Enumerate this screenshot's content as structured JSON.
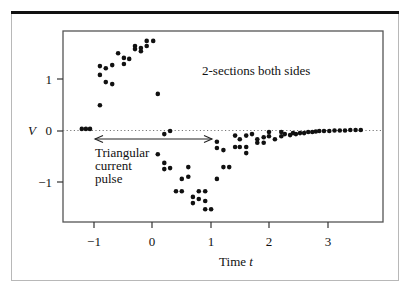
{
  "chart_data": {
    "type": "scatter",
    "title": "",
    "xlabel": "Time",
    "xlabel_var": "t",
    "ylabel": "V",
    "xlim": [
      -1.5,
      3.95
    ],
    "ylim": [
      -1.77,
      1.94
    ],
    "xticks": [
      -1,
      0,
      1,
      2,
      3
    ],
    "xtick_labels": [
      "−1",
      "0",
      "1",
      "2",
      "3"
    ],
    "yticks": [
      1,
      0,
      -1
    ],
    "ytick_labels": [
      "1",
      "0",
      "−1"
    ],
    "grid": false,
    "legend": null,
    "annotations": [
      {
        "text": "2-sections both sides",
        "x": 0.85,
        "y": 1.0
      },
      {
        "text_lines": [
          "Triangular",
          "current",
          "pulse"
        ],
        "x": -0.96,
        "y": -0.28
      },
      {
        "type": "double-arrow",
        "from": [
          -1.0,
          -0.15
        ],
        "to": [
          1.04,
          -0.15
        ]
      },
      {
        "type": "dotted-baseline",
        "y": 0
      }
    ],
    "series": [
      {
        "name": "measured V",
        "points": [
          [
            -1.2,
            0.04
          ],
          [
            -1.13,
            0.04
          ],
          [
            -1.06,
            0.04
          ],
          [
            -0.89,
            1.26
          ],
          [
            -0.79,
            1.22
          ],
          [
            -0.68,
            1.28
          ],
          [
            -0.89,
            1.09
          ],
          [
            -0.79,
            0.95
          ],
          [
            -0.68,
            0.91
          ],
          [
            -0.89,
            0.5
          ],
          [
            -0.58,
            1.51
          ],
          [
            -0.48,
            1.42
          ],
          [
            -0.39,
            1.4
          ],
          [
            -0.48,
            1.3
          ],
          [
            -0.29,
            1.65
          ],
          [
            -0.29,
            1.59
          ],
          [
            -0.19,
            1.61
          ],
          [
            -0.19,
            1.55
          ],
          [
            -0.09,
            1.75
          ],
          [
            -0.09,
            1.65
          ],
          [
            0.02,
            1.75
          ],
          [
            0.1,
            0.72
          ],
          [
            0.21,
            -0.06
          ],
          [
            0.31,
            0.0
          ],
          [
            0.1,
            -0.45
          ],
          [
            0.21,
            -0.62
          ],
          [
            0.21,
            -0.74
          ],
          [
            0.31,
            -0.72
          ],
          [
            0.62,
            -0.7
          ],
          [
            0.51,
            -0.93
          ],
          [
            0.62,
            -0.89
          ],
          [
            0.41,
            -1.17
          ],
          [
            0.51,
            -1.17
          ],
          [
            0.8,
            -1.17
          ],
          [
            0.91,
            -1.17
          ],
          [
            0.7,
            -1.28
          ],
          [
            0.8,
            -1.32
          ],
          [
            0.91,
            -1.36
          ],
          [
            0.7,
            -1.4
          ],
          [
            0.91,
            -1.52
          ],
          [
            1.01,
            -1.52
          ],
          [
            1.11,
            -0.21
          ],
          [
            1.11,
            -0.33
          ],
          [
            1.22,
            -0.37
          ],
          [
            1.22,
            -0.7
          ],
          [
            1.32,
            -0.7
          ],
          [
            1.11,
            -0.93
          ],
          [
            1.42,
            -0.09
          ],
          [
            1.5,
            -0.16
          ],
          [
            1.61,
            -0.09
          ],
          [
            1.71,
            -0.06
          ],
          [
            1.42,
            -0.31
          ],
          [
            1.5,
            -0.31
          ],
          [
            1.61,
            -0.31
          ],
          [
            1.61,
            -0.43
          ],
          [
            1.8,
            -0.16
          ],
          [
            1.8,
            -0.23
          ],
          [
            1.91,
            -0.12
          ],
          [
            1.91,
            -0.23
          ],
          [
            2.0,
            -0.02
          ],
          [
            2.0,
            -0.1
          ],
          [
            2.1,
            -0.16
          ],
          [
            2.21,
            -0.02
          ],
          [
            2.21,
            -0.1
          ],
          [
            2.27,
            -0.06
          ],
          [
            2.36,
            -0.08
          ],
          [
            2.41,
            -0.04
          ],
          [
            2.46,
            -0.06
          ],
          [
            2.53,
            -0.04
          ],
          [
            2.6,
            -0.04
          ],
          [
            2.67,
            -0.02
          ],
          [
            2.74,
            -0.02
          ],
          [
            2.8,
            -0.01
          ],
          [
            2.86,
            0.0
          ],
          [
            2.94,
            0.0
          ],
          [
            3.03,
            0.0
          ],
          [
            3.12,
            0.01
          ],
          [
            3.21,
            0.01
          ],
          [
            3.3,
            0.01
          ],
          [
            3.39,
            0.02
          ],
          [
            3.48,
            0.02
          ],
          [
            3.57,
            0.02
          ]
        ]
      }
    ]
  },
  "labels": {
    "ylabel": "V",
    "xlabel_text": "Time ",
    "xlabel_var": "t",
    "section_note": "2-sections both sides",
    "pulse_line1": "Triangular",
    "pulse_line2": "current",
    "pulse_line3": "pulse",
    "xtick_m1": "−1",
    "xtick_0": "0",
    "xtick_1": "1",
    "xtick_2": "2",
    "xtick_3": "3",
    "ytick_1": "1",
    "ytick_0": "0",
    "ytick_m1": "−1"
  }
}
